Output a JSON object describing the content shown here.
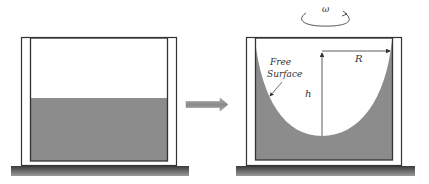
{
  "diagram": {
    "left_panel": {
      "description": "stationary container with flat liquid level"
    },
    "transition_arrow": {
      "icon": "right-arrow-icon"
    },
    "right_panel": {
      "rotation_label": "ω",
      "free_surface_label_line1": "Free",
      "free_surface_label_line2": "Surface",
      "radius_label": "R",
      "height_label": "h"
    },
    "colors": {
      "liquid": "#8c8c8c",
      "frame": "#333333",
      "ground": "#555555",
      "arrow": "#999999"
    }
  }
}
